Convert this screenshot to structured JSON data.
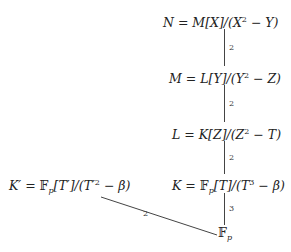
{
  "diagram": {
    "type": "field-extension-tower",
    "nodes": {
      "N": {
        "lhs": "N",
        "eq": " = ",
        "ring": "M[X]",
        "mod": "/(X",
        "exp": "2",
        "tail": " − Y)"
      },
      "M": {
        "lhs": "M",
        "eq": " = ",
        "ring": "L[Y]",
        "mod": "/(Y",
        "exp": "2",
        "tail": " − Z)"
      },
      "L": {
        "lhs": "L",
        "eq": " = ",
        "ring": "K[Z]",
        "mod": "/(Z",
        "exp": "2",
        "tail": " − T)"
      },
      "K": {
        "lhs": "K",
        "eq": " = ",
        "field": "𝔽",
        "sub": "p",
        "ring": "[T]",
        "mod": "/(T",
        "exp": "3",
        "tail": " − β)"
      },
      "Kprime": {
        "lhs": "K′",
        "eq": " = ",
        "field": "𝔽",
        "sub": "p",
        "ring": "[T′]",
        "mod": "/(T′",
        "exp": "2",
        "tail": " − β)"
      },
      "Fp": {
        "field": "𝔽",
        "sub": "p"
      }
    },
    "edges": [
      {
        "from": "M",
        "to": "N",
        "degree": "2"
      },
      {
        "from": "L",
        "to": "M",
        "degree": "2"
      },
      {
        "from": "K",
        "to": "L",
        "degree": "2"
      },
      {
        "from": "Fp",
        "to": "K",
        "degree": "3"
      },
      {
        "from": "Fp",
        "to": "Kprime",
        "degree": "2"
      }
    ]
  }
}
